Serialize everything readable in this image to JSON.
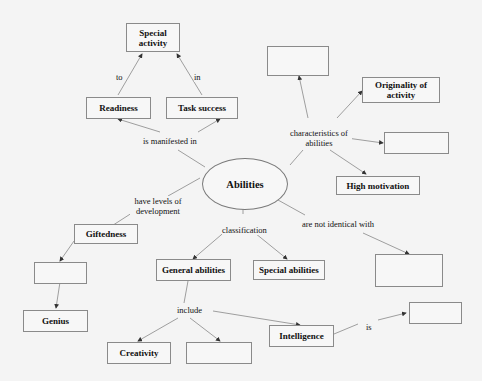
{
  "diagram": {
    "center": {
      "label": "Abilities"
    },
    "nodes": {
      "special_activity": "Special activity",
      "readiness": "Readiness",
      "task_success": "Task success",
      "originality": "Originality of activity",
      "high_motivation": "High motivation",
      "giftedness": "Giftedness",
      "genius": "Genius",
      "general_abilities": "General abilities",
      "special_abilities": "Special abilities",
      "creativity": "Creativity",
      "intelligence": "Intelligence",
      "blank_top_right": "",
      "blank_right": "",
      "blank_left_mid": "",
      "blank_include": "",
      "blank_not_identical": "",
      "blank_is": ""
    },
    "edge_labels": {
      "to": "to",
      "in": "in",
      "is_manifested_in": "is manifested in",
      "characteristics": "characteristics of abilities",
      "have_levels": "have levels of development",
      "classification": "classification",
      "not_identical": "are not identical with",
      "include": "include",
      "is": "is"
    }
  }
}
